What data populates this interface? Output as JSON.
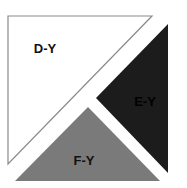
{
  "diagram": {
    "regions": [
      {
        "id": "d-y",
        "label": "D-Y",
        "fill": "#ffffff",
        "stroke": "#8a8a8a",
        "text_color": "#111111",
        "points": "8,16 152,16 8,164",
        "label_x": 45,
        "label_y": 53
      },
      {
        "id": "e-y",
        "label": "E-Y",
        "fill": "#1c1c1c",
        "stroke": "none",
        "text_color": "#000000",
        "points": "168,24 168,173 96,98",
        "label_x": 145,
        "label_y": 106
      },
      {
        "id": "f-y",
        "label": "F-Y",
        "fill": "#7a7a7a",
        "stroke": "none",
        "text_color": "#111111",
        "points": "88,107 15,181 160,181",
        "label_x": 84,
        "label_y": 165
      }
    ]
  }
}
